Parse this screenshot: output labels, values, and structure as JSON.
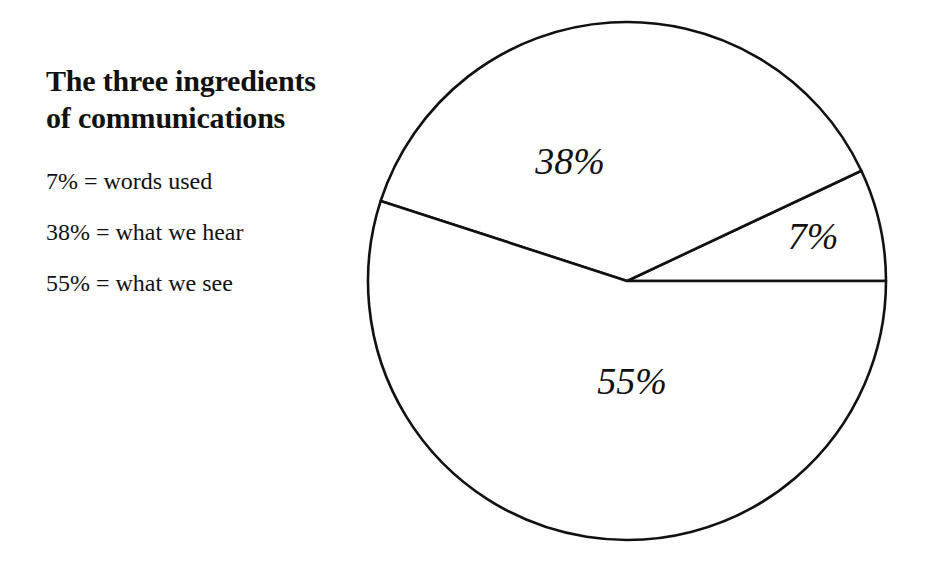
{
  "page": {
    "background_color": "#ffffff",
    "ink_color": "#111111",
    "width": 936,
    "height": 563
  },
  "title": {
    "text": "The three ingredients\nof communications"
  },
  "legend": {
    "items": [
      {
        "label": "7% = words used"
      },
      {
        "label": "38% = what we hear"
      },
      {
        "label": "55% = what we see"
      }
    ]
  },
  "chart_data": {
    "type": "pie",
    "title": "The three ingredients of communications",
    "subtitle": "",
    "xlabel": "",
    "ylabel": "",
    "grid": false,
    "legend_position": "left",
    "units": "percent",
    "total": 100,
    "fill_color": "#ffffff",
    "stroke_color": "#111111",
    "start_angle_deg": 0,
    "direction": "counterclockwise",
    "categories": [
      "words used",
      "what we hear",
      "what we see"
    ],
    "values": [
      7,
      38,
      55
    ],
    "slices": [
      {
        "name": "words used",
        "value": 7,
        "label": "7%",
        "start_angle_deg": 0,
        "end_angle_deg": 25.2,
        "label_x": 813,
        "label_y": 240
      },
      {
        "name": "what we hear",
        "value": 38,
        "label": "38%",
        "start_angle_deg": 25.2,
        "end_angle_deg": 162,
        "label_x": 570,
        "label_y": 165
      },
      {
        "name": "what we see",
        "value": 55,
        "label": "55%",
        "start_angle_deg": 162,
        "end_angle_deg": 360,
        "label_x": 632,
        "label_y": 385
      }
    ],
    "geometry": {
      "center_x": 627,
      "center_y": 281,
      "radius": 259
    }
  }
}
